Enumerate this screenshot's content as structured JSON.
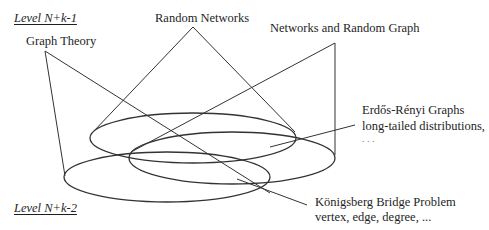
{
  "levels": {
    "upper": "Level N+k-1",
    "lower": "Level N+k-2"
  },
  "concepts": {
    "graph_theory": "Graph Theory",
    "random_networks": "Random Networks",
    "networks_random_graph": "Networks and Random Graph"
  },
  "annotations": {
    "erdos": {
      "line1": "Erdős-Rényi Graphs",
      "line2": "long-tailed distributions,",
      "line3": ". . ."
    },
    "konigsberg": {
      "line1": "Königsberg Bridge Problem",
      "line2": "vertex, edge, degree, ..."
    }
  },
  "colors": {
    "stroke": "#333333",
    "text": "#1e1e1e",
    "background": "#ffffff"
  }
}
